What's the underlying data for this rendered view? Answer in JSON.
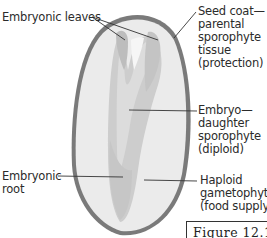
{
  "diagram": {
    "type": "labeled-illustration",
    "labels": {
      "embryonic_leaves": "Embryonic leaves",
      "seed_coat": [
        "Seed coat—",
        "parental",
        "sporophyte",
        "tissue",
        "(protection)"
      ],
      "embryo": [
        "Embryo—",
        "daughter",
        "sporophyte",
        "(diploid)"
      ],
      "embryonic_root": [
        "Embryonic",
        "root"
      ],
      "haploid": [
        "Haploid",
        "gametophyte",
        "(food supply)"
      ]
    },
    "figure_caption": "Figure 12.1",
    "colors": {
      "seed_coat": "#6e6e6e",
      "endosperm": "#e9e9e9",
      "embryo_outer": "#cfcfcf",
      "embryo_inner": "#dadada",
      "leader_line": "#333333"
    }
  }
}
